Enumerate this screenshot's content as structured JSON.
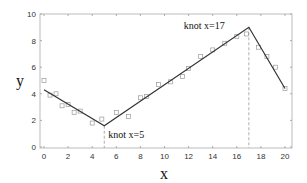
{
  "chart_data": {
    "type": "line",
    "title": "",
    "xlabel": "x",
    "ylabel": "y",
    "xlim": [
      0,
      20
    ],
    "ylim": [
      0,
      10
    ],
    "xticks": [
      0,
      2,
      4,
      6,
      8,
      10,
      12,
      14,
      16,
      18,
      20
    ],
    "yticks": [
      0,
      2,
      4,
      6,
      8,
      10
    ],
    "grid": false,
    "series": [
      {
        "name": "piecewise linear fit",
        "style": "solid line",
        "color": "#333333",
        "x": [
          0,
          5,
          17,
          20
        ],
        "y": [
          4.3,
          1.6,
          9.0,
          4.4
        ]
      },
      {
        "name": "data",
        "style": "open square markers",
        "color": "#999999",
        "x": [
          0,
          0.5,
          1,
          1.5,
          2,
          2.5,
          3,
          4,
          4.8,
          6,
          7,
          8,
          8.5,
          9.5,
          10.5,
          11.5,
          12,
          13,
          14,
          15,
          16,
          16.8,
          17.8,
          18.5,
          19.2,
          20
        ],
        "y": [
          5.0,
          3.9,
          4.0,
          3.1,
          3.2,
          2.6,
          2.7,
          1.8,
          2.1,
          2.6,
          2.3,
          3.7,
          3.8,
          4.7,
          4.9,
          5.3,
          5.9,
          6.8,
          7.3,
          7.8,
          8.3,
          8.5,
          7.5,
          6.8,
          6.0,
          4.4
        ]
      }
    ],
    "knots": [
      {
        "x": 5,
        "label": "knot x=5"
      },
      {
        "x": 17,
        "label": "knot x=17"
      }
    ]
  }
}
